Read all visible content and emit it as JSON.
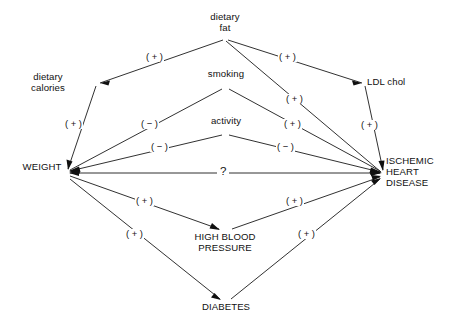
{
  "figure": {
    "type": "causal-path-diagram",
    "width": 458,
    "height": 331,
    "background": "#ffffff",
    "line_color": "#1a1a1a",
    "text_color": "#111111"
  },
  "nodes": [
    {
      "id": "dietary-fat",
      "label": "dietary\nfat",
      "x": 225,
      "y": 18,
      "align": "center"
    },
    {
      "id": "dietary-calories",
      "label": "dietary\ncalories",
      "x": 48,
      "y": 78,
      "align": "center"
    },
    {
      "id": "smoking",
      "label": "smoking",
      "x": 226,
      "y": 75,
      "align": "center"
    },
    {
      "id": "ldl-chol",
      "label": "LDL chol",
      "x": 390,
      "y": 83,
      "align": "center"
    },
    {
      "id": "activity",
      "label": "activity",
      "x": 226,
      "y": 122,
      "align": "center"
    },
    {
      "id": "weight",
      "label": "WEIGHT",
      "x": 42,
      "y": 167,
      "align": "center"
    },
    {
      "id": "ihd",
      "label": "ISCHEMIC\nHEART\nDISEASE",
      "x": 419,
      "y": 161,
      "align": "left"
    },
    {
      "id": "high-blood-pressure",
      "label": "HIGH BLOOD\nPRESSURE",
      "x": 225,
      "y": 237,
      "align": "center"
    },
    {
      "id": "diabetes",
      "label": "DIABETES",
      "x": 225,
      "y": 307,
      "align": "center"
    }
  ],
  "edges": [
    {
      "id": "fat-to-calories",
      "from": "dietary-fat",
      "to": "dietary-calories",
      "sign": "( + )",
      "label_x": 157,
      "label_y": 53
    },
    {
      "id": "fat-to-ldl",
      "from": "dietary-fat",
      "to": "ldl-chol",
      "sign": "( + )",
      "label_x": 290,
      "label_y": 53
    },
    {
      "id": "fat-to-ihd",
      "from": "dietary-fat",
      "to": "ihd",
      "sign": "( + )",
      "label_x": 297,
      "label_y": 95
    },
    {
      "id": "calories-to-weight",
      "from": "dietary-calories",
      "to": "weight",
      "sign": "( + )",
      "label_x": 76,
      "label_y": 120
    },
    {
      "id": "ldl-to-ihd",
      "from": "ldl-chol",
      "to": "ihd",
      "sign": "( + )",
      "label_x": 372,
      "label_y": 121
    },
    {
      "id": "smoking-to-weight",
      "from": "smoking",
      "to": "weight",
      "sign": "( − )",
      "label_x": 152,
      "label_y": 120
    },
    {
      "id": "smoking-to-ihd",
      "from": "smoking",
      "to": "ihd",
      "sign": "( + )",
      "label_x": 295,
      "label_y": 120
    },
    {
      "id": "activity-to-weight",
      "from": "activity",
      "to": "weight",
      "sign": "( − )",
      "label_x": 162,
      "label_y": 143
    },
    {
      "id": "activity-to-ihd",
      "from": "activity",
      "to": "ihd",
      "sign": "( − )",
      "label_x": 288,
      "label_y": 143
    },
    {
      "id": "weight-to-ihd",
      "from": "weight",
      "to": "ihd",
      "sign": "?",
      "label_x": 219,
      "label_y": 166
    },
    {
      "id": "weight-to-hbp",
      "from": "weight",
      "to": "high-blood-pressure",
      "sign": "( + )",
      "label_x": 147,
      "label_y": 197
    },
    {
      "id": "hbp-to-ihd",
      "from": "high-blood-pressure",
      "to": "ihd",
      "sign": "( + )",
      "label_x": 297,
      "label_y": 197
    },
    {
      "id": "weight-to-diabetes",
      "from": "weight",
      "to": "diabetes",
      "sign": "( + )",
      "label_x": 137,
      "label_y": 230
    },
    {
      "id": "diabetes-to-ihd",
      "from": "diabetes",
      "to": "ihd",
      "sign": "( + )",
      "label_x": 309,
      "label_y": 230
    }
  ]
}
